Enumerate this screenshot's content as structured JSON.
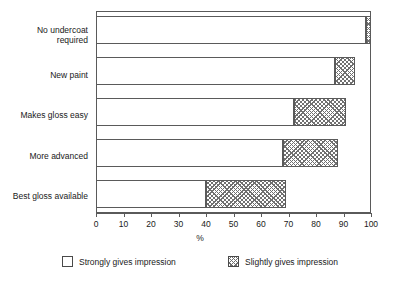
{
  "chart_data": {
    "type": "bar",
    "orientation": "horizontal",
    "stacked": true,
    "title": "",
    "xlabel": "%",
    "ylabel": "",
    "xlim": [
      0,
      100
    ],
    "xticks": [
      0,
      10,
      20,
      30,
      40,
      50,
      60,
      70,
      80,
      90,
      100
    ],
    "grid": false,
    "legend_position": "bottom",
    "categories": [
      "No undercoat\nrequired",
      "New paint",
      "Makes gloss easy",
      "More advanced",
      "Best gloss available"
    ],
    "series": [
      {
        "name": "Strongly gives impression",
        "fill": "white",
        "values": [
          98,
          87,
          72,
          68,
          40
        ]
      },
      {
        "name": "Slightly gives impression",
        "fill": "crosshatch",
        "values": [
          2,
          7,
          19,
          20,
          29
        ]
      }
    ],
    "totals": [
      100,
      94,
      91,
      88,
      69
    ]
  },
  "axis": {
    "x_title": "%",
    "tick_labels": [
      "0",
      "10",
      "20",
      "30",
      "40",
      "50",
      "60",
      "70",
      "80",
      "90",
      "100"
    ]
  },
  "legend": {
    "items": [
      {
        "label": "Strongly gives impression",
        "swatch": "empty-box-icon"
      },
      {
        "label": "Slightly gives impression",
        "swatch": "crosshatch-box-icon"
      }
    ]
  },
  "colors": {
    "axis": "#5a5a5a",
    "bar_outline": "#5a5a5a",
    "hatch": "#707070",
    "background": "#ffffff",
    "text": "#1a1a1a"
  }
}
